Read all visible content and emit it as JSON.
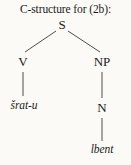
{
  "figure": {
    "caption": "C-structure for (2b):",
    "background_color": "#fbfaf7",
    "line_color": "#3a3a3a",
    "text_color": "#1b1b1b"
  },
  "tree": {
    "type": "constituency-tree",
    "nodes": [
      {
        "id": "S",
        "label": "S",
        "kind": "category",
        "x": 62,
        "y": 25
      },
      {
        "id": "V",
        "label": "V",
        "kind": "category",
        "x": 23,
        "y": 62
      },
      {
        "id": "NP",
        "label": "NP",
        "kind": "category",
        "x": 102,
        "y": 62
      },
      {
        "id": "N",
        "label": "N",
        "kind": "category",
        "x": 102,
        "y": 108
      },
      {
        "id": "srat",
        "label": "šrat-u",
        "kind": "leaf",
        "x": 24,
        "y": 106
      },
      {
        "id": "lbent",
        "label": "lbent",
        "kind": "leaf",
        "x": 102,
        "y": 150
      }
    ],
    "edges": [
      {
        "from": "S",
        "to": "V"
      },
      {
        "from": "S",
        "to": "NP"
      },
      {
        "from": "V",
        "to": "srat"
      },
      {
        "from": "NP",
        "to": "N"
      },
      {
        "from": "N",
        "to": "lbent"
      }
    ]
  }
}
